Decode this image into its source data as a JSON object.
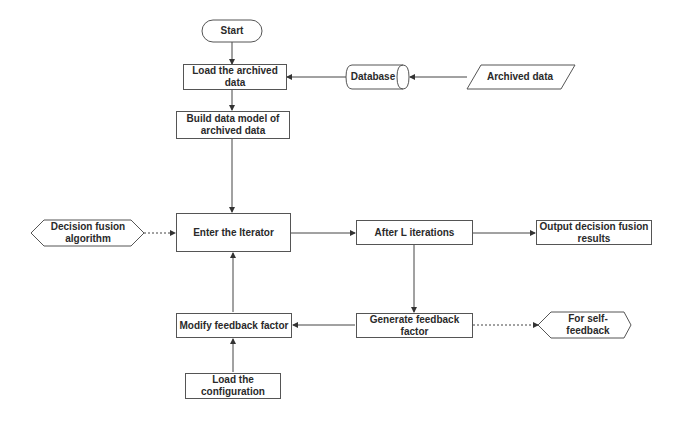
{
  "diagram": {
    "type": "flowchart",
    "nodes": {
      "start": {
        "label": "Start",
        "shape": "terminator"
      },
      "load_archived": {
        "label": "Load the archived data",
        "shape": "process"
      },
      "build_model": {
        "label": "Build data model of archived data",
        "shape": "process"
      },
      "database": {
        "label": "Database",
        "shape": "cylinder"
      },
      "archived_data": {
        "label": "Archived data",
        "shape": "parallelogram"
      },
      "decision_fusion_algorithm": {
        "label": "Decision fusion algorithm",
        "shape": "hexagon"
      },
      "enter_iterator": {
        "label": "Enter the Iterator",
        "shape": "process"
      },
      "after_iterations": {
        "label": "After L iterations",
        "shape": "process"
      },
      "output_results": {
        "label": "Output decision fusion results",
        "shape": "process"
      },
      "modify_feedback": {
        "label": "Modify feedback factor",
        "shape": "process"
      },
      "generate_feedback": {
        "label": "Generate feedback factor",
        "shape": "process"
      },
      "self_feedback": {
        "label": "For self-feedback",
        "shape": "hexagon"
      },
      "load_config": {
        "label": "Load the configuration",
        "shape": "process"
      }
    },
    "edges": [
      {
        "from": "start",
        "to": "load_archived",
        "style": "solid"
      },
      {
        "from": "archived_data",
        "to": "database",
        "style": "solid"
      },
      {
        "from": "database",
        "to": "load_archived",
        "style": "solid"
      },
      {
        "from": "load_archived",
        "to": "build_model",
        "style": "solid"
      },
      {
        "from": "build_model",
        "to": "enter_iterator",
        "style": "solid"
      },
      {
        "from": "decision_fusion_algorithm",
        "to": "enter_iterator",
        "style": "dotted"
      },
      {
        "from": "enter_iterator",
        "to": "after_iterations",
        "style": "solid"
      },
      {
        "from": "after_iterations",
        "to": "output_results",
        "style": "solid"
      },
      {
        "from": "after_iterations",
        "to": "generate_feedback",
        "style": "solid"
      },
      {
        "from": "generate_feedback",
        "to": "modify_feedback",
        "style": "solid"
      },
      {
        "from": "generate_feedback",
        "to": "self_feedback",
        "style": "dotted"
      },
      {
        "from": "modify_feedback",
        "to": "enter_iterator",
        "style": "solid"
      },
      {
        "from": "load_config",
        "to": "modify_feedback",
        "style": "solid"
      }
    ]
  }
}
